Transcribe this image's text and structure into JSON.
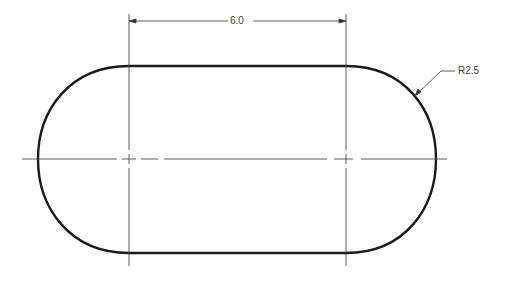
{
  "drawing": {
    "type": "slot (obround) technical drawing",
    "colors": {
      "outline": "#1a1a1a",
      "thin_line": "#4a4a4a",
      "background": "#ffffff"
    },
    "dimensions": {
      "center_distance_label": "6.0",
      "radius_label": "R2.5"
    },
    "geometry": {
      "left_center_x": 129,
      "right_center_x": 346,
      "center_y": 159,
      "top_y": 66,
      "bottom_y": 253,
      "left_extreme_x": 38,
      "right_extreme_x": 436,
      "dimension_line_y": 21
    }
  }
}
